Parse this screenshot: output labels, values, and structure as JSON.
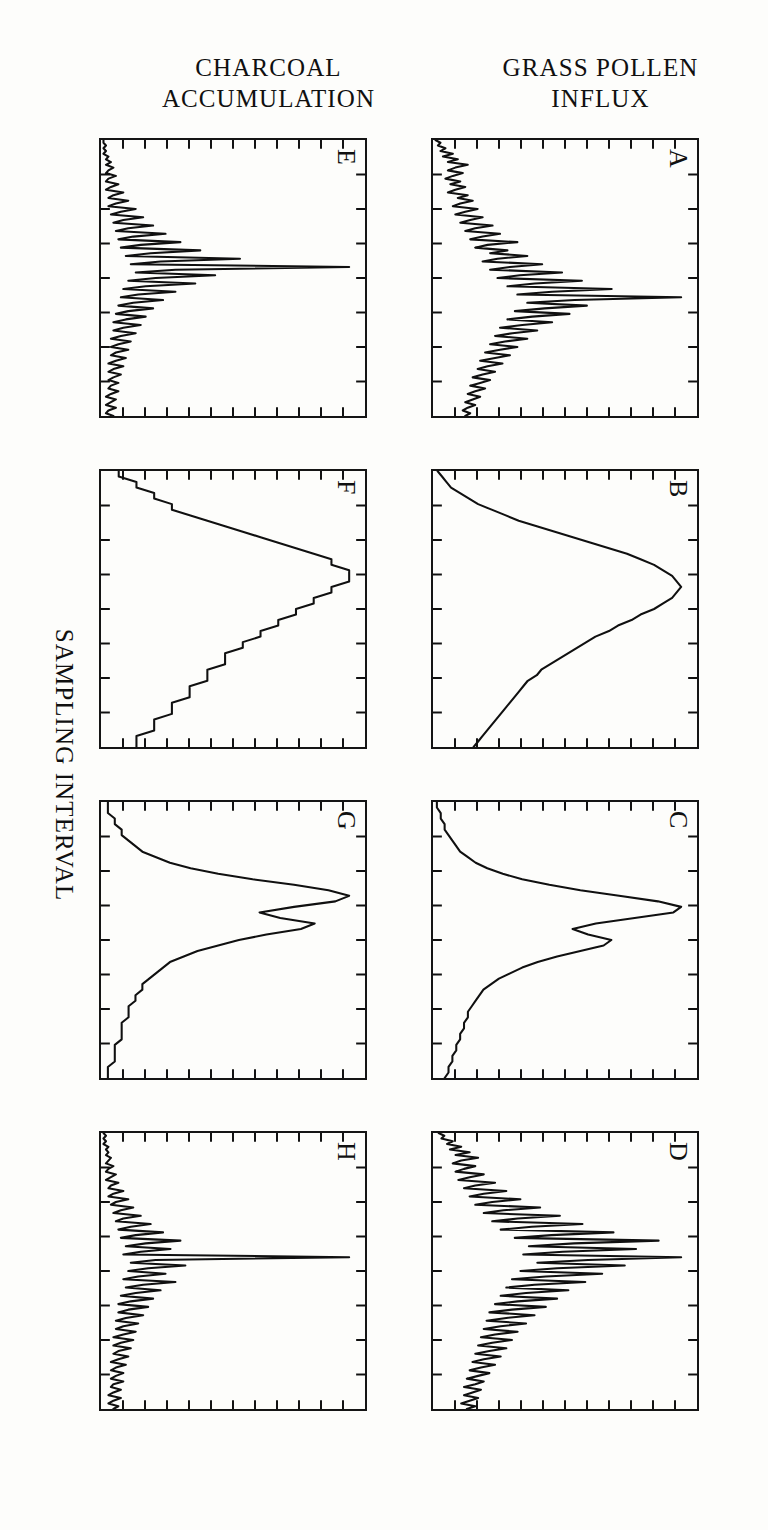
{
  "figure": {
    "orientation_note": "rotated-90-degrees-in-scan",
    "y_axis_titles": {
      "pollen": "GRASS POLLEN\nINFLUX",
      "charcoal": "CHARCOAL\nACCUMULATION"
    },
    "x_axis_title": "SAMPLING INTERVAL",
    "panel_labels": [
      "A",
      "B",
      "C",
      "D",
      "E",
      "F",
      "G",
      "H"
    ],
    "ink_color": "#101010",
    "paper_color": "#fdfdfb"
  },
  "chart_data": {
    "type": "line",
    "title": "",
    "xlabel": "SAMPLING INTERVAL",
    "ylabel": "GRASS POLLEN INFLUX / CHARCOAL ACCUMULATION",
    "grid": false,
    "legend": "none",
    "xlim": [
      0,
      100
    ],
    "ylim": [
      0,
      100
    ],
    "panel_rows": [
      {
        "name": "GRASS POLLEN INFLUX",
        "panels": [
          "A",
          "B",
          "C",
          "D"
        ]
      },
      {
        "name": "CHARCOAL ACCUMULATION",
        "panels": [
          "E",
          "F",
          "G",
          "H"
        ]
      }
    ],
    "panels": [
      {
        "label": "A",
        "row": "GRASS POLLEN INFLUX",
        "note": "finest sampling interval; high-frequency spiky series with one dominant peak",
        "x": [
          0,
          1,
          2,
          3,
          4,
          5,
          6,
          7,
          8,
          9,
          10,
          11,
          12,
          13,
          14,
          15,
          16,
          17,
          18,
          19,
          20,
          21,
          22,
          23,
          24,
          25,
          26,
          27,
          28,
          29,
          30,
          31,
          32,
          33,
          34,
          35,
          36,
          37,
          38,
          39,
          40,
          41,
          42,
          43,
          44,
          45,
          46,
          47,
          48,
          49,
          50,
          51,
          52,
          53,
          54,
          55,
          56,
          57,
          58,
          59,
          60,
          61,
          62,
          63,
          64,
          65,
          66,
          67,
          68,
          69,
          70,
          71,
          72,
          73,
          74,
          75,
          76,
          77,
          78,
          79,
          80,
          81,
          82,
          83,
          84,
          85,
          86,
          87,
          88,
          89,
          90,
          91,
          92,
          93,
          94,
          95,
          96,
          97,
          98,
          99,
          100
        ],
        "y": [
          1,
          3,
          2,
          5,
          3,
          8,
          4,
          10,
          6,
          14,
          9,
          6,
          12,
          8,
          5,
          11,
          7,
          13,
          9,
          6,
          14,
          10,
          16,
          11,
          8,
          18,
          13,
          9,
          20,
          15,
          11,
          24,
          17,
          13,
          27,
          20,
          15,
          34,
          22,
          17,
          30,
          23,
          38,
          26,
          20,
          44,
          31,
          23,
          52,
          35,
          26,
          60,
          41,
          30,
          72,
          48,
          34,
          100,
          57,
          38,
          62,
          45,
          33,
          55,
          40,
          30,
          48,
          36,
          27,
          42,
          32,
          25,
          38,
          29,
          23,
          34,
          27,
          21,
          31,
          25,
          19,
          28,
          22,
          18,
          25,
          20,
          16,
          23,
          19,
          15,
          21,
          17,
          14,
          19,
          16,
          13,
          17,
          14,
          12,
          15,
          13
        ]
      },
      {
        "label": "B",
        "row": "GRASS POLLEN INFLUX",
        "note": "coarse sampling interval; smooth broad single-humped curve",
        "x": [
          0,
          2,
          4,
          6,
          8,
          10,
          12,
          14,
          16,
          18,
          20,
          22,
          24,
          26,
          28,
          30,
          32,
          34,
          36,
          38,
          40,
          42,
          44,
          46,
          48,
          50,
          52,
          54,
          56,
          58,
          60,
          62,
          64,
          66,
          68,
          70,
          72,
          74,
          76,
          78,
          80,
          82,
          84,
          86,
          88,
          90,
          92,
          94,
          96,
          98,
          100
        ],
        "y": [
          1,
          2,
          3,
          4,
          6,
          8,
          10,
          13,
          16,
          19,
          23,
          27,
          31,
          35,
          39,
          43,
          46,
          49,
          51,
          53,
          54,
          55,
          54,
          53,
          51,
          49,
          46,
          44,
          41,
          39,
          36,
          34,
          32,
          30,
          28,
          26,
          24,
          23,
          21,
          20,
          19,
          18,
          17,
          16,
          15,
          14,
          13,
          12,
          11,
          10,
          9
        ]
      },
      {
        "label": "C",
        "row": "GRASS POLLEN INFLUX",
        "note": "intermediate sampling interval; one narrow tall peak plus a secondary shoulder",
        "x": [
          0,
          2,
          4,
          6,
          8,
          10,
          12,
          14,
          16,
          18,
          20,
          22,
          24,
          26,
          28,
          30,
          32,
          34,
          36,
          38,
          40,
          42,
          44,
          46,
          48,
          50,
          52,
          54,
          56,
          58,
          60,
          62,
          64,
          66,
          68,
          70,
          72,
          74,
          76,
          78,
          80,
          82,
          84,
          86,
          88,
          90,
          92,
          94,
          96,
          98,
          100
        ],
        "y": [
          1,
          1,
          2,
          2,
          3,
          3,
          4,
          5,
          6,
          7,
          9,
          11,
          14,
          18,
          23,
          30,
          38,
          48,
          58,
          64,
          62,
          52,
          42,
          36,
          40,
          46,
          44,
          38,
          32,
          27,
          23,
          20,
          17,
          15,
          13,
          12,
          11,
          10,
          9,
          9,
          8,
          8,
          7,
          7,
          6,
          6,
          5,
          5,
          4,
          4,
          3
        ]
      },
      {
        "label": "D",
        "row": "GRASS POLLEN INFLUX",
        "note": "fine sampling interval; jagged multi-peaked series with several tall spikes",
        "x": [
          0,
          1,
          2,
          3,
          4,
          5,
          6,
          7,
          8,
          9,
          10,
          11,
          12,
          13,
          14,
          15,
          16,
          17,
          18,
          19,
          20,
          21,
          22,
          23,
          24,
          25,
          26,
          27,
          28,
          29,
          30,
          31,
          32,
          33,
          34,
          35,
          36,
          37,
          38,
          39,
          40,
          41,
          42,
          43,
          44,
          45,
          46,
          47,
          48,
          49,
          50,
          51,
          52,
          53,
          54,
          55,
          56,
          57,
          58,
          59,
          60,
          61,
          62,
          63,
          64,
          65,
          66,
          67,
          68,
          69,
          70,
          71,
          72,
          73,
          74,
          75,
          76,
          77,
          78,
          79,
          80,
          81,
          82,
          83,
          84,
          85,
          86,
          87,
          88,
          89,
          90,
          91,
          92,
          93,
          94,
          95,
          96,
          97,
          98,
          99,
          100
        ],
        "y": [
          2,
          4,
          3,
          7,
          5,
          10,
          6,
          13,
          8,
          16,
          10,
          7,
          15,
          11,
          8,
          18,
          13,
          9,
          22,
          15,
          11,
          26,
          18,
          13,
          31,
          21,
          15,
          38,
          25,
          18,
          45,
          30,
          21,
          53,
          35,
          24,
          64,
          42,
          29,
          80,
          50,
          34,
          72,
          46,
          32,
          88,
          55,
          37,
          68,
          44,
          31,
          60,
          40,
          28,
          54,
          36,
          26,
          48,
          33,
          24,
          44,
          30,
          22,
          40,
          28,
          20,
          36,
          26,
          19,
          33,
          24,
          18,
          30,
          22,
          17,
          28,
          21,
          16,
          26,
          20,
          15,
          24,
          18,
          14,
          22,
          17,
          13,
          20,
          16,
          12,
          18,
          15,
          11,
          17,
          14,
          11,
          16,
          13,
          10,
          15,
          12
        ]
      },
      {
        "label": "E",
        "row": "CHARCOAL ACCUMULATION",
        "note": "finest sampling interval; very narrow spikes, one dominant peak near the middle",
        "x": [
          0,
          1,
          2,
          3,
          4,
          5,
          6,
          7,
          8,
          9,
          10,
          11,
          12,
          13,
          14,
          15,
          16,
          17,
          18,
          19,
          20,
          21,
          22,
          23,
          24,
          25,
          26,
          27,
          28,
          29,
          30,
          31,
          32,
          33,
          34,
          35,
          36,
          37,
          38,
          39,
          40,
          41,
          42,
          43,
          44,
          45,
          46,
          47,
          48,
          49,
          50,
          51,
          52,
          53,
          54,
          55,
          56,
          57,
          58,
          59,
          60,
          61,
          62,
          63,
          64,
          65,
          66,
          67,
          68,
          69,
          70,
          71,
          72,
          73,
          74,
          75,
          76,
          77,
          78,
          79,
          80,
          81,
          82,
          83,
          84,
          85,
          86,
          87,
          88,
          89,
          90,
          91,
          92,
          93,
          94,
          95,
          96,
          97,
          98,
          99,
          100
        ],
        "y": [
          1,
          1,
          2,
          1,
          2,
          1,
          3,
          2,
          4,
          2,
          5,
          3,
          2,
          6,
          3,
          2,
          7,
          4,
          2,
          9,
          5,
          3,
          11,
          6,
          3,
          14,
          8,
          4,
          17,
          9,
          5,
          21,
          11,
          6,
          26,
          13,
          7,
          32,
          16,
          8,
          40,
          20,
          10,
          56,
          24,
          12,
          100,
          30,
          14,
          46,
          22,
          11,
          38,
          18,
          9,
          30,
          15,
          8,
          25,
          13,
          7,
          21,
          11,
          6,
          18,
          10,
          5,
          16,
          9,
          5,
          14,
          8,
          4,
          12,
          7,
          4,
          11,
          6,
          4,
          10,
          6,
          3,
          9,
          5,
          3,
          8,
          5,
          3,
          7,
          4,
          3,
          7,
          4,
          2,
          6,
          4,
          2,
          6,
          3,
          2,
          5
        ]
      },
      {
        "label": "F",
        "row": "CHARCOAL ACCUMULATION",
        "note": "coarse sampling interval; nearly flat, low-amplitude trace with slight broad rise",
        "x": [
          0,
          2,
          4,
          6,
          8,
          10,
          12,
          14,
          16,
          18,
          20,
          22,
          24,
          26,
          28,
          30,
          32,
          34,
          36,
          38,
          40,
          42,
          44,
          46,
          48,
          50,
          52,
          54,
          56,
          58,
          60,
          62,
          64,
          66,
          68,
          70,
          72,
          74,
          76,
          78,
          80,
          82,
          84,
          86,
          88,
          90,
          92,
          94,
          96,
          98,
          100
        ],
        "y": [
          1,
          1,
          2,
          2,
          3,
          3,
          4,
          4,
          5,
          6,
          7,
          8,
          9,
          10,
          11,
          12,
          13,
          13,
          14,
          14,
          14,
          13,
          13,
          12,
          12,
          11,
          11,
          10,
          10,
          9,
          9,
          8,
          8,
          7,
          7,
          7,
          6,
          6,
          6,
          5,
          5,
          5,
          4,
          4,
          4,
          3,
          3,
          3,
          2,
          2,
          2
        ]
      },
      {
        "label": "G",
        "row": "CHARCOAL ACCUMULATION",
        "note": "intermediate sampling interval; one moderate peak with a secondary bump",
        "x": [
          0,
          2,
          4,
          6,
          8,
          10,
          12,
          14,
          16,
          18,
          20,
          22,
          24,
          26,
          28,
          30,
          32,
          34,
          36,
          38,
          40,
          42,
          44,
          46,
          48,
          50,
          52,
          54,
          56,
          58,
          60,
          62,
          64,
          66,
          68,
          70,
          72,
          74,
          76,
          78,
          80,
          82,
          84,
          86,
          88,
          90,
          92,
          94,
          96,
          98,
          100
        ],
        "y": [
          1,
          1,
          1,
          2,
          2,
          3,
          3,
          4,
          5,
          6,
          8,
          10,
          13,
          17,
          22,
          28,
          33,
          36,
          34,
          28,
          23,
          26,
          31,
          29,
          24,
          20,
          17,
          14,
          12,
          10,
          9,
          8,
          7,
          6,
          6,
          5,
          5,
          4,
          4,
          4,
          3,
          3,
          3,
          3,
          2,
          2,
          2,
          2,
          1,
          1,
          1
        ]
      },
      {
        "label": "H",
        "row": "CHARCOAL ACCUMULATION",
        "note": "fine sampling interval; one very tall narrow spike plus smaller jagged peaks",
        "x": [
          0,
          1,
          2,
          3,
          4,
          5,
          6,
          7,
          8,
          9,
          10,
          11,
          12,
          13,
          14,
          15,
          16,
          17,
          18,
          19,
          20,
          21,
          22,
          23,
          24,
          25,
          26,
          27,
          28,
          29,
          30,
          31,
          32,
          33,
          34,
          35,
          36,
          37,
          38,
          39,
          40,
          41,
          42,
          43,
          44,
          45,
          46,
          47,
          48,
          49,
          50,
          51,
          52,
          53,
          54,
          55,
          56,
          57,
          58,
          59,
          60,
          61,
          62,
          63,
          64,
          65,
          66,
          67,
          68,
          69,
          70,
          71,
          72,
          73,
          74,
          75,
          76,
          77,
          78,
          79,
          80,
          81,
          82,
          83,
          84,
          85,
          86,
          87,
          88,
          89,
          90,
          91,
          92,
          93,
          94,
          95,
          96,
          97,
          98,
          99,
          100
        ],
        "y": [
          1,
          2,
          1,
          2,
          1,
          3,
          2,
          3,
          2,
          4,
          3,
          2,
          5,
          3,
          2,
          6,
          4,
          2,
          7,
          4,
          3,
          9,
          5,
          3,
          11,
          6,
          4,
          13,
          8,
          5,
          16,
          9,
          6,
          20,
          12,
          7,
          25,
          14,
          8,
          32,
          18,
          10,
          28,
          16,
          9,
          100,
          22,
          12,
          34,
          19,
          11,
          26,
          15,
          9,
          30,
          17,
          10,
          24,
          14,
          8,
          21,
          12,
          7,
          19,
          11,
          7,
          17,
          10,
          6,
          15,
          9,
          6,
          14,
          9,
          5,
          13,
          8,
          5,
          12,
          7,
          5,
          11,
          7,
          4,
          10,
          6,
          4,
          9,
          6,
          4,
          9,
          5,
          4,
          8,
          5,
          3,
          8,
          5,
          3,
          7,
          5
        ]
      }
    ]
  }
}
